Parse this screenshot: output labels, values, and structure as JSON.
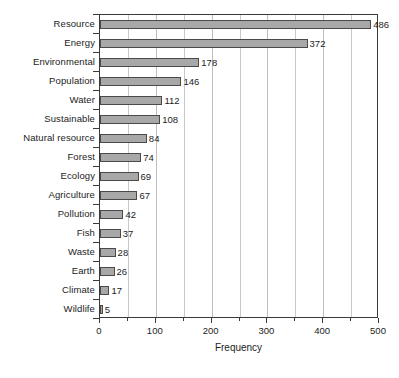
{
  "chart_data": {
    "type": "bar",
    "orientation": "horizontal",
    "title": "",
    "subtitle": "",
    "xlabel": "Frequency",
    "ylabel": "",
    "categories": [
      "Resource",
      "Energy",
      "Environmental",
      "Population",
      "Water",
      "Sustainable",
      "Natural resource",
      "Forest",
      "Ecology",
      "Agriculture",
      "Pollution",
      "Fish",
      "Waste",
      "Earth",
      "Climate",
      "Wildlife"
    ],
    "values": [
      486,
      372,
      178,
      146,
      112,
      108,
      84,
      74,
      69,
      67,
      42,
      37,
      28,
      26,
      17,
      5
    ],
    "data_labels": [
      "486",
      "372",
      "178",
      "146",
      "112",
      "108",
      "84",
      "74",
      "69",
      "67",
      "42",
      "37",
      "28",
      "26",
      "17",
      "5"
    ],
    "xlim": [
      0,
      500
    ],
    "xticks": [
      0,
      100,
      200,
      300,
      400,
      500
    ],
    "xtick_labels": [
      "0",
      "100",
      "200",
      "300",
      "400",
      "500"
    ],
    "minor_tick_interval": 50,
    "grid": {
      "vertical": true,
      "horizontal": false,
      "interval": 50,
      "color": "#c9c9c9"
    },
    "legend": null,
    "bar_fill_color": "#a8a8a8",
    "bar_border_color": "#4a4a4a",
    "axis_color": "#3a3a3a",
    "background_color": "#ffffff",
    "text_color": "#1c1c1c"
  }
}
